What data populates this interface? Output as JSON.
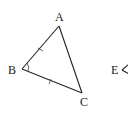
{
  "diagram": {
    "type": "geometry",
    "triangle": {
      "vertices": {
        "A": {
          "label": "A",
          "x": 59,
          "y": 26
        },
        "B": {
          "label": "B",
          "x": 22,
          "y": 69
        },
        "C": {
          "label": "C",
          "x": 82,
          "y": 93
        }
      },
      "equal_sides": [
        "AB",
        "BC"
      ],
      "angle_marks": [
        "B"
      ]
    },
    "partial_figure": {
      "vertex_label": "E",
      "vertex": {
        "x": 124,
        "y": 70
      }
    },
    "colors": {
      "line": "#222222",
      "background": "#ffffff"
    }
  }
}
